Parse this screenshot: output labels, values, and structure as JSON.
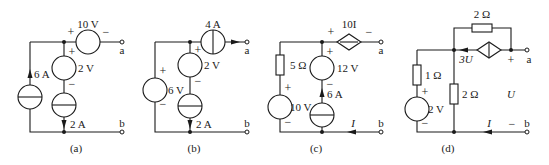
{
  "figure": {
    "colors": {
      "stroke": "#1a1a1a",
      "background": "#ffffff"
    }
  },
  "circuits": {
    "a": {
      "caption": "(a)",
      "series_source": {
        "label": "10 V",
        "plus": "+",
        "minus": "−"
      },
      "left_source": {
        "label": "6 A"
      },
      "middle_voltage": {
        "label": "2 V",
        "plus": "+",
        "minus": "−"
      },
      "middle_current": {
        "label": "2 A"
      },
      "terminal_a": "a",
      "terminal_b": "b"
    },
    "b": {
      "caption": "(b)",
      "series_source": {
        "label": "4 A"
      },
      "left_source": {
        "label": "6 V",
        "plus": "+",
        "minus": "−"
      },
      "middle_voltage": {
        "label": "2 V",
        "plus": "+",
        "minus": "−"
      },
      "middle_current": {
        "label": "2 A"
      },
      "terminal_a": "a",
      "terminal_b": "b"
    },
    "c": {
      "caption": "(c)",
      "dependent_source": {
        "label": "10I",
        "plus": "+",
        "minus": "−"
      },
      "resistor": {
        "label": "5 Ω"
      },
      "left_source": {
        "label": "10 V",
        "plus": "+",
        "minus": "−"
      },
      "middle_voltage": {
        "label": "12 V",
        "plus": "+",
        "minus": "−"
      },
      "middle_current": {
        "label": "6 A"
      },
      "current_label": "I",
      "terminal_a": "a",
      "terminal_b": "b"
    },
    "d": {
      "caption": "(d)",
      "top_resistor": {
        "label": "2 Ω"
      },
      "dependent_source": {
        "label": "3U"
      },
      "left_resistor": {
        "label": "1 Ω"
      },
      "left_source": {
        "label": "2 V",
        "plus": "+",
        "minus": "−"
      },
      "middle_resistor": {
        "label": "2 Ω"
      },
      "voltage_label": "U",
      "voltage_plus": "+",
      "voltage_minus": "−",
      "current_label": "I",
      "terminal_a": "a",
      "terminal_b": "b"
    }
  }
}
